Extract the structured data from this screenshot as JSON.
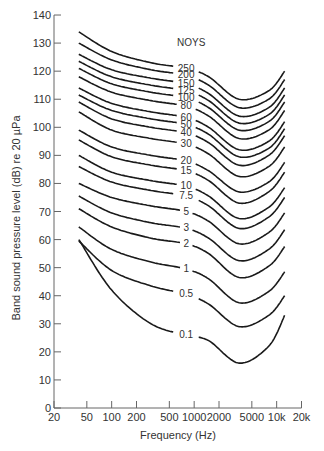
{
  "chart_data": {
    "type": "line",
    "title": "",
    "xlabel": "Frequency (Hz)",
    "ylabel": "Band sound pressure level (dB) re 20 µPa",
    "x_scale": "log",
    "xlim": [
      20,
      20000
    ],
    "ylim": [
      0,
      140
    ],
    "x_ticks": [
      20,
      50,
      100,
      200,
      500,
      1000,
      2000,
      5000,
      10000,
      20000
    ],
    "x_tick_labels": [
      "20",
      "50",
      "100",
      "200",
      "500",
      "1000",
      "2000",
      "5000",
      "10k",
      "20k"
    ],
    "y_ticks": [
      0,
      10,
      20,
      30,
      40,
      50,
      60,
      70,
      80,
      90,
      100,
      110,
      120,
      130,
      140
    ],
    "y_tick_labels": [
      "0",
      "10",
      "20",
      "30",
      "40",
      "50",
      "60",
      "70",
      "80",
      "90",
      "100",
      "110",
      "120",
      "130",
      "140"
    ],
    "grid": false,
    "legend_title": "NOYS",
    "x": [
      40,
      100,
      300,
      800,
      1500,
      3500,
      8000,
      12500
    ],
    "series": [
      {
        "name": "250",
        "values": [
          134,
          127,
          123,
          121,
          118,
          110,
          113,
          120
        ]
      },
      {
        "name": "200",
        "values": [
          130,
          124,
          120.5,
          118.5,
          115,
          107,
          110,
          117
        ]
      },
      {
        "name": "150",
        "values": [
          126,
          120.5,
          117.5,
          115.5,
          112,
          104,
          107,
          114
        ]
      },
      {
        "name": "125",
        "values": [
          123.5,
          118,
          115,
          113,
          109.5,
          101.5,
          104.5,
          111.5
        ]
      },
      {
        "name": "100",
        "values": [
          121,
          115.5,
          112.5,
          110.5,
          107,
          99,
          102,
          109
        ]
      },
      {
        "name": "80",
        "values": [
          118,
          112.5,
          109.5,
          107.5,
          104,
          96,
          99,
          106
        ]
      },
      {
        "name": "60",
        "values": [
          114,
          108.5,
          105.5,
          103.5,
          100,
          92,
          95,
          102
        ]
      },
      {
        "name": "50",
        "values": [
          111.5,
          106,
          103,
          101,
          97.5,
          89.5,
          92.5,
          99.5
        ]
      },
      {
        "name": "40",
        "values": [
          109,
          103,
          100,
          98,
          94.5,
          86.5,
          90,
          97
        ]
      },
      {
        "name": "30",
        "values": [
          105.5,
          99,
          96,
          94,
          90.5,
          82.5,
          86,
          93
        ]
      },
      {
        "name": "20",
        "values": [
          99,
          93,
          90,
          88,
          84.5,
          77,
          80.5,
          87.5
        ]
      },
      {
        "name": "15",
        "values": [
          95.5,
          89.5,
          86.5,
          84.5,
          81,
          73,
          77,
          84
        ]
      },
      {
        "name": "10",
        "values": [
          90,
          84,
          81,
          79,
          75.5,
          67.5,
          71.5,
          78.5
        ]
      },
      {
        "name": "7.5",
        "values": [
          86,
          80.5,
          77.5,
          75.5,
          72,
          64,
          68,
          75
        ]
      },
      {
        "name": "5",
        "values": [
          80,
          75,
          72,
          70,
          66.5,
          58.5,
          62.5,
          69.5
        ]
      },
      {
        "name": "3",
        "values": [
          75.5,
          69.5,
          66,
          64,
          60.5,
          52.5,
          56.5,
          63.5
        ]
      },
      {
        "name": "2",
        "values": [
          71,
          64.5,
          60.5,
          58.5,
          55,
          46.5,
          50.5,
          57.5
        ]
      },
      {
        "name": "1",
        "values": [
          64.5,
          56.5,
          52,
          49.5,
          46,
          37.5,
          41.5,
          48.5
        ]
      },
      {
        "name": "0.5",
        "values": [
          59.5,
          49,
          43.5,
          40.5,
          37,
          29,
          33,
          40
        ]
      },
      {
        "name": "0.1",
        "values": [
          60,
          42,
          30,
          26,
          24,
          16,
          22,
          33
        ]
      }
    ]
  }
}
